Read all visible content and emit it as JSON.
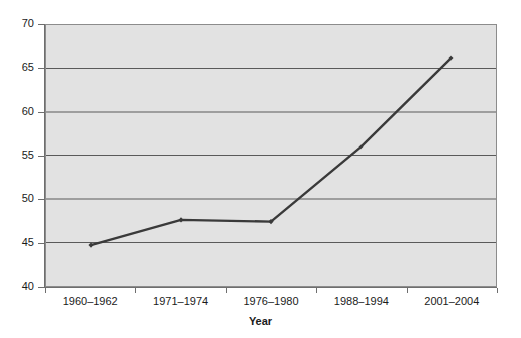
{
  "chart_data": {
    "type": "line",
    "title": "",
    "subtitle": "",
    "xlabel": "Year",
    "ylabel": "",
    "categories": [
      "1960–1962",
      "1971–1974",
      "1976–1980",
      "1988–1994",
      "2001–2004"
    ],
    "values": [
      44.7,
      47.6,
      47.4,
      56.0,
      66.2
    ],
    "series": [
      {
        "name": "",
        "values": [
          44.7,
          47.6,
          47.4,
          56.0,
          66.2
        ]
      }
    ],
    "ylim": [
      40,
      70
    ],
    "yticks": [
      40,
      45,
      50,
      55,
      60,
      65,
      70
    ],
    "ytick_labels": [
      "40",
      "45",
      "50",
      "55",
      "60",
      "65",
      "70"
    ],
    "grid": true,
    "grid_axis": "y",
    "legend": false,
    "legend_position": "none",
    "markers": true,
    "colors": {
      "line": "#3a3a3a",
      "marker": "#3a3a3a",
      "plot_background": "#e2e2e2",
      "page_background": "#ffffff",
      "gridline": "#5a5a5a",
      "axis": "#6e6e6e",
      "text": "#1a1a1a"
    }
  }
}
